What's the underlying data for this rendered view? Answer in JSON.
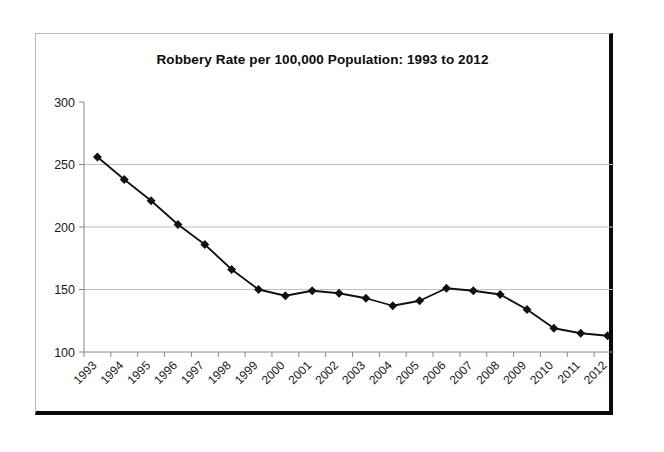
{
  "chart_data": {
    "type": "line",
    "title": "Robbery Rate per 100,000 Population: 1993 to 2012",
    "xlabel": "",
    "ylabel": "",
    "categories": [
      "1993",
      "1994",
      "1995",
      "1996",
      "1997",
      "1998",
      "1999",
      "2000",
      "2001",
      "2002",
      "2003",
      "2004",
      "2005",
      "2006",
      "2007",
      "2008",
      "2009",
      "2010",
      "2011",
      "2012"
    ],
    "values": [
      256,
      238,
      221,
      202,
      186,
      166,
      150,
      145,
      149,
      147,
      143,
      137,
      141,
      151,
      149,
      146,
      134,
      119,
      115,
      113
    ],
    "yticks": [
      100,
      150,
      200,
      250,
      300
    ],
    "ylim": [
      100,
      300
    ],
    "grid": "horizontal",
    "legend": "none",
    "marker": "filled-diamond",
    "line_color": "#111111",
    "marker_color": "#111111",
    "gridline_color": "#bfbfbf",
    "axis_color": "#888888",
    "xtick_rotation": -45
  }
}
